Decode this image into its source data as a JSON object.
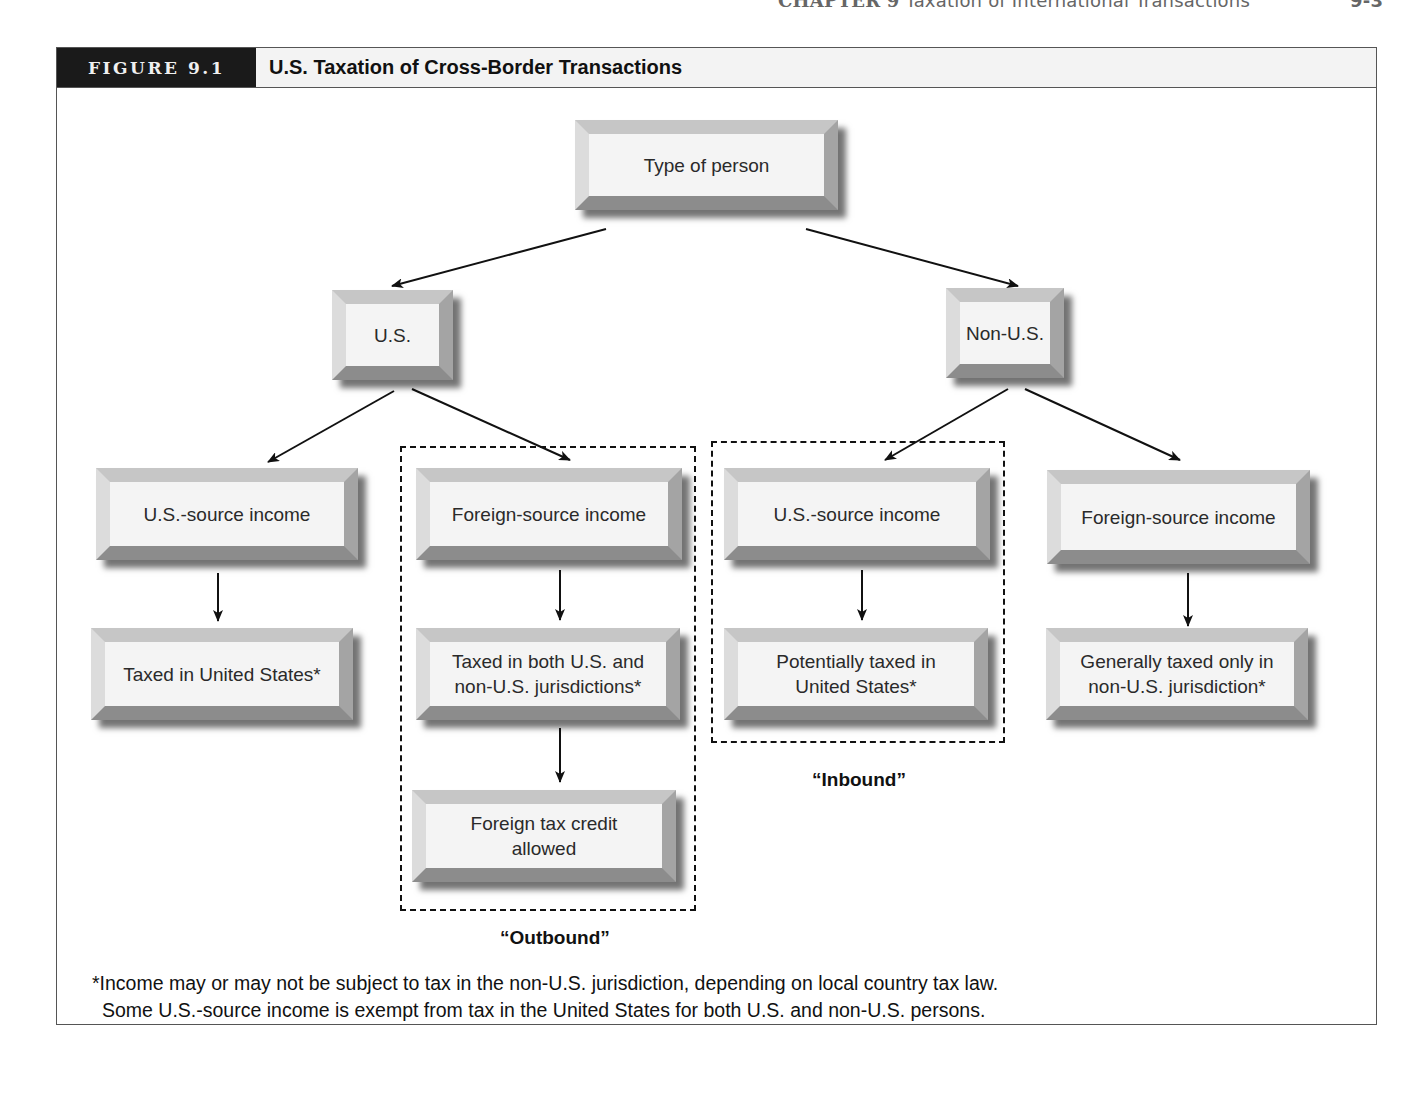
{
  "page_header": {
    "chapter": "CHAPTER 9",
    "running_title": "Taxation of International Transactions",
    "page_number": "9-3"
  },
  "figure": {
    "label": "FIGURE 9.1",
    "title": "U.S. Taxation of Cross-Border Transactions"
  },
  "nodes": {
    "root": "Type of person",
    "us": "U.S.",
    "non_us": "Non-U.S.",
    "us_us_source": "U.S.-source income",
    "us_foreign_source": "Foreign-source income",
    "nonus_us_source": "U.S.-source income",
    "nonus_foreign_source": "Foreign-source income",
    "taxed_us": "Taxed in United States*",
    "taxed_both_line1": "Taxed in both U.S. and",
    "taxed_both_line2": "non-U.S. jurisdictions*",
    "ftc_line1": "Foreign tax credit",
    "ftc_line2": "allowed",
    "potentially_line1": "Potentially taxed in",
    "potentially_line2": "United States*",
    "generally_line1": "Generally taxed only in",
    "generally_line2": "non-U.S. jurisdiction*"
  },
  "regions": {
    "outbound": "“Outbound”",
    "inbound": "“Inbound”"
  },
  "footnote": {
    "line1": "*Income may or may not be subject to tax in the non-U.S. jurisdiction, depending on local country tax law.",
    "line2": "Some U.S.-source income is exempt from tax in the United States for both U.S. and non-U.S. persons."
  },
  "edges": [
    {
      "from": "root",
      "to": "us"
    },
    {
      "from": "root",
      "to": "non_us"
    },
    {
      "from": "us",
      "to": "us_us_source"
    },
    {
      "from": "us",
      "to": "us_foreign_source"
    },
    {
      "from": "non_us",
      "to": "nonus_us_source"
    },
    {
      "from": "non_us",
      "to": "nonus_foreign_source"
    },
    {
      "from": "us_us_source",
      "to": "taxed_us"
    },
    {
      "from": "us_foreign_source",
      "to": "taxed_both"
    },
    {
      "from": "taxed_both",
      "to": "ftc"
    },
    {
      "from": "nonus_us_source",
      "to": "potentially"
    },
    {
      "from": "nonus_foreign_source",
      "to": "generally"
    }
  ]
}
